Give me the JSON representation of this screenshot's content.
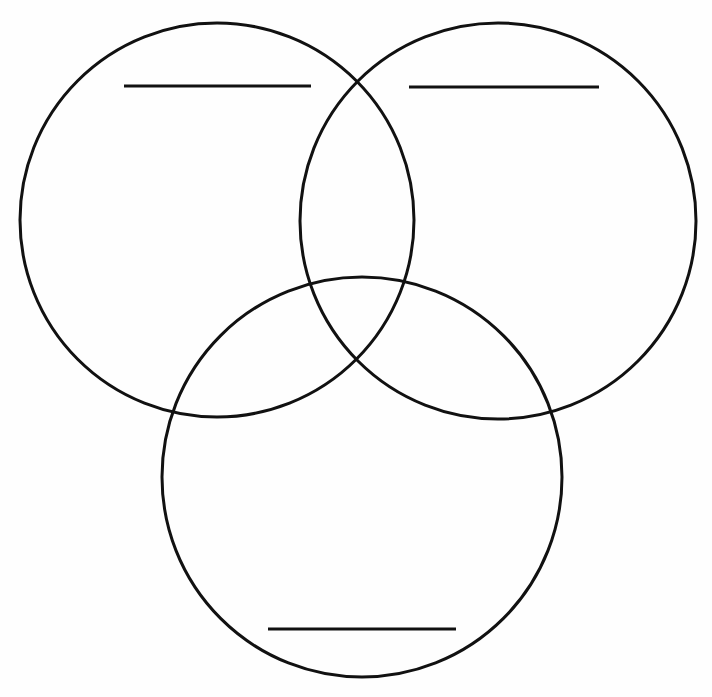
{
  "diagram": {
    "type": "venn-3",
    "stroke_color": "#111111",
    "background": "#fefefe",
    "circles": [
      {
        "id": "A",
        "position": "top-left",
        "cx": 217,
        "cy": 220,
        "r": 197,
        "label": ""
      },
      {
        "id": "B",
        "position": "top-right",
        "cx": 498,
        "cy": 221,
        "r": 198,
        "label": ""
      },
      {
        "id": "C",
        "position": "bottom",
        "cx": 362,
        "cy": 477,
        "r": 200,
        "label": ""
      }
    ],
    "label_lines": [
      {
        "circle": "A",
        "x1": 124,
        "x2": 311,
        "y": 86
      },
      {
        "circle": "B",
        "x1": 409,
        "x2": 599,
        "y": 87
      },
      {
        "circle": "C",
        "x1": 268,
        "x2": 456,
        "y": 629
      }
    ]
  }
}
